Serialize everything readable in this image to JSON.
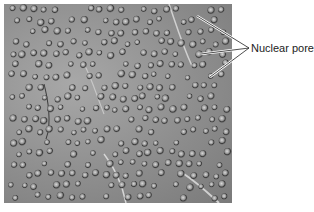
{
  "figure": {
    "image_description": "Freeze-fracture electron micrograph of nuclear envelope showing many nuclear pores",
    "annotation": {
      "label": "Nuclear pores",
      "pointer_count": 3
    }
  }
}
